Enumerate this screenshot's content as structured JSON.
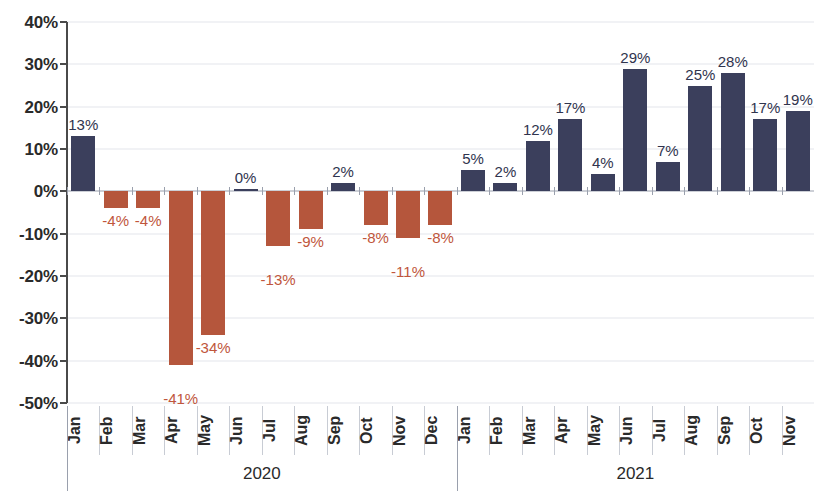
{
  "chart_data": {
    "type": "bar",
    "title": "",
    "subtitle": "",
    "xlabel": "",
    "ylabel": "",
    "ylim": [
      -50,
      40
    ],
    "ytick_labels": [
      "40%",
      "30%",
      "20%",
      "10%",
      "0%",
      "-10%",
      "-20%",
      "-30%",
      "-40%",
      "-50%"
    ],
    "ytick_values": [
      40,
      30,
      20,
      10,
      0,
      -10,
      -20,
      -30,
      -40,
      -50
    ],
    "grid": true,
    "legend": "none",
    "value_format": "percent",
    "categories": [
      "Jan",
      "Feb",
      "Mar",
      "Apr",
      "May",
      "Jun",
      "Jul",
      "Aug",
      "Sep",
      "Oct",
      "Nov",
      "Dec",
      "Jan",
      "Feb",
      "Mar",
      "Apr",
      "May",
      "Jun",
      "Jul",
      "Aug",
      "Sep",
      "Oct",
      "Nov"
    ],
    "values": [
      13,
      -4,
      -4,
      -41,
      -34,
      0,
      -13,
      -9,
      2,
      -8,
      -11,
      -8,
      5,
      2,
      12,
      17,
      4,
      29,
      7,
      25,
      28,
      17,
      19
    ],
    "data_labels": [
      "13%",
      "-4%",
      "-4%",
      "-41%",
      "-34%",
      "0%",
      "-13%",
      "-9%",
      "2%",
      "-8%",
      "-11%",
      "-8%",
      "5%",
      "2%",
      "12%",
      "17%",
      "4%",
      "29%",
      "7%",
      "25%",
      "28%",
      "17%",
      "19%"
    ],
    "groups": [
      {
        "label": "2020",
        "start_index": 0,
        "count": 12
      },
      {
        "label": "2021",
        "start_index": 12,
        "count": 11
      }
    ],
    "colors": {
      "positive": "#3b3f5c",
      "negative": "#b5563c",
      "positive_label": "#30344e",
      "negative_label": "#c0563c",
      "gridline": "#e4e6ec",
      "axis": "#4a4a4a",
      "zero_line": "#9aa0ad"
    }
  }
}
